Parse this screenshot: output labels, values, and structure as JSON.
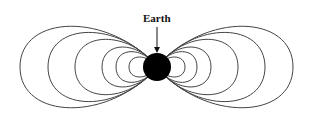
{
  "diagram": {
    "label": "Earth",
    "earth": {
      "cx": 157,
      "cy": 67,
      "r": 14,
      "color": "#000000"
    },
    "line_color": "#444444",
    "left_loops": [
      {
        "x": 20,
        "ry": 53
      },
      {
        "x": 48,
        "ry": 45
      },
      {
        "x": 75,
        "ry": 36
      },
      {
        "x": 102,
        "ry": 26
      },
      {
        "x": 116,
        "ry": 20
      },
      {
        "x": 129,
        "ry": 13
      }
    ],
    "right_loops": [
      {
        "x": 293,
        "ry": 53
      },
      {
        "x": 265,
        "ry": 45
      },
      {
        "x": 238,
        "ry": 36
      },
      {
        "x": 211,
        "ry": 26
      },
      {
        "x": 197,
        "ry": 20
      },
      {
        "x": 185,
        "ry": 13
      }
    ]
  }
}
